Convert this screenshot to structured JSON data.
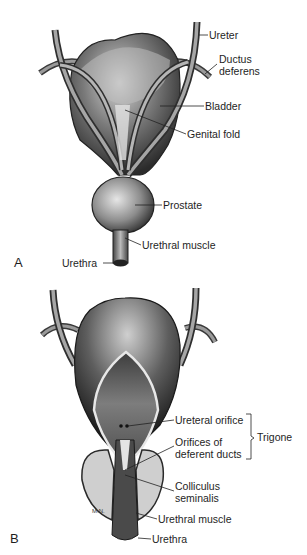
{
  "figure": {
    "panel_a": {
      "letter": "A",
      "labels": {
        "ureter": "Ureter",
        "ductus_deferens_1": "Ductus",
        "ductus_deferens_2": "deferens",
        "bladder": "Bladder",
        "genital_fold": "Genital fold",
        "prostate": "Prostate",
        "urethral_muscle": "Urethral muscle",
        "urethra": "Urethra"
      }
    },
    "panel_b": {
      "letter": "B",
      "labels": {
        "ureteral_orifice": "Ureteral orifice",
        "orifices_1": "Orifices of",
        "orifices_2": "deferent ducts",
        "trigone": "Trigone",
        "colliculus_1": "Colliculus",
        "colliculus_2": "seminalis",
        "urethral_muscle": "Urethral muscle",
        "urethra": "Urethra"
      },
      "artist_mark": "M.N."
    },
    "colors": {
      "background": "#ffffff",
      "ink": "#1e1e1e",
      "dark_tissue": "#3a3a3a",
      "mid_tissue": "#8a8a8a",
      "light_tissue": "#c9c9c9"
    }
  }
}
